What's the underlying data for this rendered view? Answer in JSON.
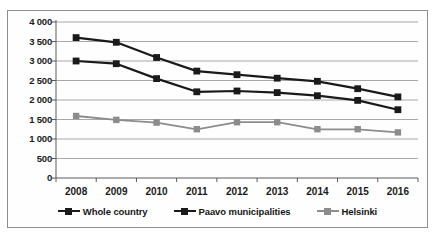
{
  "chart_data": {
    "type": "line",
    "title": "",
    "xlabel": "",
    "ylabel": "",
    "x": [
      2008,
      2009,
      2010,
      2011,
      2012,
      2013,
      2014,
      2015,
      2016
    ],
    "categories": [
      "2008",
      "2009",
      "2010",
      "2011",
      "2012",
      "2013",
      "2014",
      "2015",
      "2016"
    ],
    "ylim": [
      0,
      4000
    ],
    "ytick_values": [
      0,
      500,
      1000,
      1500,
      2000,
      2500,
      3000,
      3500,
      4000
    ],
    "ytick_labels": [
      "0",
      "500",
      "1 000",
      "1 500",
      "2 000",
      "2 500",
      "3 000",
      "3 500",
      "4 000"
    ],
    "grid": true,
    "grid_axis": "y",
    "legend_position": "bottom",
    "series": [
      {
        "name": "Whole country",
        "color": "#1a1a1a",
        "marker": "square",
        "values": [
          3600,
          3480,
          3090,
          2740,
          2650,
          2560,
          2480,
          2290,
          2080
        ]
      },
      {
        "name": "Paavo municipalities",
        "color": "#1a1a1a",
        "marker": "square",
        "values": [
          3000,
          2930,
          2550,
          2210,
          2230,
          2190,
          2110,
          1990,
          1750
        ]
      },
      {
        "name": "Helsinki",
        "color": "#8c8c8c",
        "marker": "square",
        "values": [
          1590,
          1490,
          1420,
          1250,
          1430,
          1430,
          1250,
          1250,
          1170
        ]
      }
    ]
  },
  "colors": {
    "series_dark": "#1a1a1a",
    "series_gray": "#8c8c8c",
    "gridline": "#a8a8a8",
    "axis": "#5a5a5a",
    "frame": "#8e8e8e",
    "text": "#1b1b1b"
  }
}
